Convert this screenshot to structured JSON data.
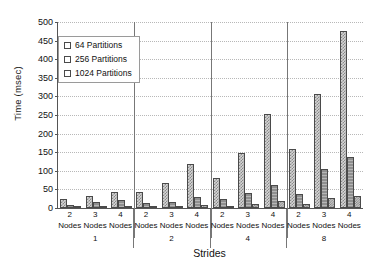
{
  "chart_data": {
    "type": "bar",
    "title": "",
    "xlabel": "Strides",
    "ylabel": "Time (msec)",
    "ylim": [
      0,
      500
    ],
    "ytick_step": 50,
    "yticks": [
      0,
      50,
      100,
      150,
      200,
      250,
      300,
      350,
      400,
      450,
      500
    ],
    "grid": true,
    "legend_position": "upper-left",
    "group_labels": [
      "1",
      "2",
      "4",
      "8"
    ],
    "group_axis_name": "Strides",
    "subgroup_labels": [
      "2\nNodes",
      "3\nNodes",
      "4\nNodes"
    ],
    "categories": [
      "1 / 2 Nodes",
      "1 / 3 Nodes",
      "1 / 4 Nodes",
      "2 / 2 Nodes",
      "2 / 3 Nodes",
      "2 / 4 Nodes",
      "4 / 2 Nodes",
      "4 / 3 Nodes",
      "4 / 4 Nodes",
      "8 / 2 Nodes",
      "8 / 3 Nodes",
      "8 / 4 Nodes"
    ],
    "series": [
      {
        "name": "64 Partitions",
        "color": "#d5d5d5",
        "values": [
          23,
          31,
          44,
          44,
          68,
          118,
          80,
          149,
          254,
          158,
          306,
          475
        ]
      },
      {
        "name": "256 Partitions",
        "color": "#8f8f8f",
        "values": [
          8,
          15,
          21,
          13,
          17,
          30,
          23,
          40,
          62,
          37,
          104,
          137
        ]
      },
      {
        "name": "1024 Partitions",
        "color": "#c9c9c9",
        "values": [
          3,
          4,
          4,
          3,
          5,
          7,
          5,
          11,
          20,
          10,
          27,
          33
        ]
      }
    ]
  },
  "legend": {
    "items": [
      {
        "label": "64 Partitions"
      },
      {
        "label": "256 Partitions"
      },
      {
        "label": "1024 Partitions"
      }
    ]
  },
  "axes": {
    "y_title": "Time (msec)",
    "x_title": "Strides"
  },
  "node_labels": {
    "n2_top": "2",
    "n2_bottom": "Nodes",
    "n3_top": "3",
    "n3_bottom": "Nodes",
    "n4_top": "4",
    "n4_bottom": "Nodes"
  }
}
